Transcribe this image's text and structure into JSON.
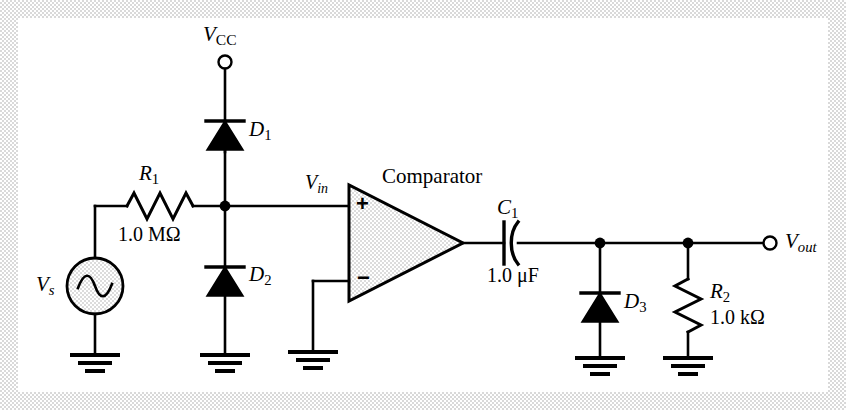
{
  "figure": {
    "kind": "circuit-schematic",
    "background_color": "#ffffff",
    "ink_color": "#000000",
    "frame_color": "#d9d9d9",
    "fill_color": "#ececec"
  },
  "labels": {
    "vcc": {
      "symbol": "V",
      "subscript": "CC",
      "text": "VCC"
    },
    "vs": {
      "symbol": "V",
      "subscript": "s",
      "text": "Vs"
    },
    "vin": {
      "symbol": "V",
      "subscript": "in",
      "text": "Vin"
    },
    "vout": {
      "symbol": "V",
      "subscript": "out",
      "text": "Vout"
    },
    "comparator": {
      "text": "Comparator"
    },
    "plus_input": {
      "text": "+"
    },
    "minus_input": {
      "text": "−"
    },
    "r1": {
      "symbol": "R",
      "subscript": "1",
      "value": "1.0 MΩ"
    },
    "r2": {
      "symbol": "R",
      "subscript": "2",
      "value": "1.0 kΩ"
    },
    "c1": {
      "symbol": "C",
      "subscript": "1",
      "value": "1.0 μF"
    },
    "d1": {
      "symbol": "D",
      "subscript": "1"
    },
    "d2": {
      "symbol": "D",
      "subscript": "2"
    },
    "d3": {
      "symbol": "D",
      "subscript": "3"
    }
  },
  "components": [
    {
      "id": "vs",
      "type": "ac-voltage-source",
      "name": "Vs"
    },
    {
      "id": "r1",
      "type": "resistor",
      "name": "R1",
      "value": "1.0 MΩ"
    },
    {
      "id": "d1",
      "type": "diode",
      "name": "D1",
      "orientation": "anode-bottom"
    },
    {
      "id": "d2",
      "type": "diode",
      "name": "D2",
      "orientation": "anode-bottom"
    },
    {
      "id": "comparator",
      "type": "comparator",
      "name": "Comparator"
    },
    {
      "id": "c1",
      "type": "capacitor",
      "name": "C1",
      "value": "1.0 μF"
    },
    {
      "id": "d3",
      "type": "diode",
      "name": "D3",
      "orientation": "anode-bottom"
    },
    {
      "id": "r2",
      "type": "resistor",
      "name": "R2",
      "value": "1.0 kΩ"
    }
  ],
  "terminals": [
    {
      "id": "vcc",
      "name": "VCC",
      "style": "open-circle"
    },
    {
      "id": "vout",
      "name": "Vout",
      "style": "open-circle"
    }
  ],
  "grounds": [
    {
      "id": "gnd-vs"
    },
    {
      "id": "gnd-d2"
    },
    {
      "id": "gnd-comparator"
    },
    {
      "id": "gnd-d3"
    },
    {
      "id": "gnd-r2"
    }
  ]
}
